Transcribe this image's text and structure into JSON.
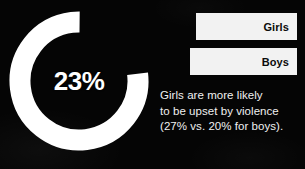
{
  "background_color": "#050505",
  "accent_color": "#ffffff",
  "donut": {
    "value_label": "23%",
    "aria_name": "donut-chart"
  },
  "bars": [
    {
      "label": "Girls",
      "value": 27,
      "bar_color": "#f2f2f2",
      "label_color": "#0b0b0b"
    },
    {
      "label": "Boys",
      "value": 20,
      "bar_color": "#f2f2f2",
      "label_color": "#0b0b0b"
    }
  ],
  "caption": {
    "line1": "Girls are more likely",
    "line2": "to be upset by violence",
    "line3": "(27% vs. 20% for boys)."
  },
  "chart_data": {
    "type": "pie",
    "title": "",
    "subtitle": "",
    "xlabel": "",
    "ylabel": "",
    "legend_position": "none",
    "grid": false,
    "donut": {
      "type": "donut",
      "center_label": "23%",
      "slices": [
        {
          "name": "highlighted",
          "value": 23,
          "color": "#050505"
        },
        {
          "name": "remainder",
          "value": 77,
          "color": "#ffffff"
        }
      ],
      "start_angle_deg": 0,
      "direction": "clockwise"
    },
    "bars": {
      "type": "bar",
      "orientation": "horizontal",
      "categories": [
        "Girls",
        "Boys"
      ],
      "values": [
        27,
        20
      ],
      "unit": "%",
      "xlim": [
        0,
        100
      ]
    },
    "annotations": [
      "Girls are more likely",
      "to be upset by violence",
      "(27% vs. 20% for boys)."
    ]
  }
}
